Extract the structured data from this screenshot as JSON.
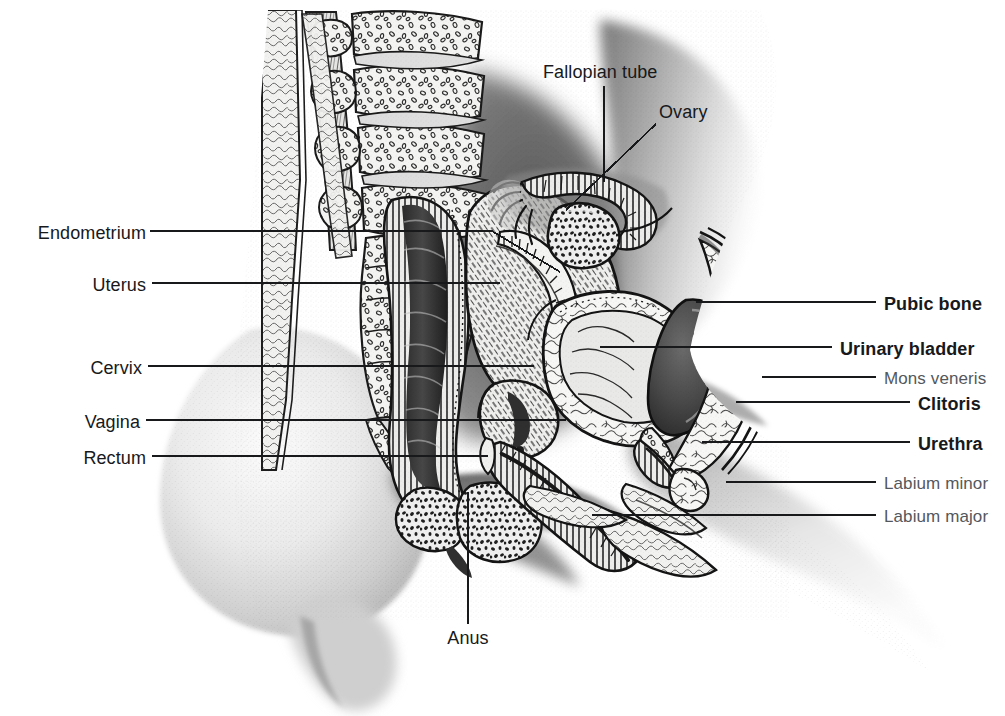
{
  "figure": {
    "style": "black-and-white engraving / stipple illustration",
    "background_color": "#ffffff",
    "ink_color": "#17191b",
    "secondary_ink_color": "#54585c"
  },
  "labels": {
    "left": [
      {
        "id": "endometrium",
        "text": "Endometrium",
        "x": 146,
        "y": 235,
        "leader_to_x": 492,
        "leader_to_y": 235,
        "leader_kink_x": 492,
        "leader_kink_y": 235,
        "leader_end_x": 556,
        "leader_end_y": 272
      },
      {
        "id": "uterus",
        "text": "Uterus",
        "x": 92,
        "y": 288,
        "leader_to_x": 498,
        "leader_to_y": 288,
        "leader_kink_x": 498,
        "leader_kink_y": 288,
        "leader_end_x": 498,
        "leader_end_y": 288
      },
      {
        "id": "cervix",
        "text": "Cervix",
        "x": 95,
        "y": 371,
        "leader_to_x": 530,
        "leader_to_y": 371,
        "leader_kink_x": 530,
        "leader_kink_y": 371,
        "leader_end_x": 530,
        "leader_end_y": 371
      },
      {
        "id": "vagina",
        "text": "Vagina",
        "x": 89,
        "y": 425,
        "leader_to_x": 560,
        "leader_to_y": 425,
        "leader_kink_x": 560,
        "leader_kink_y": 425,
        "leader_end_x": 560,
        "leader_end_y": 425
      },
      {
        "id": "rectum",
        "text": "Rectum",
        "x": 102,
        "y": 461,
        "leader_to_x": 487,
        "leader_to_y": 461,
        "leader_kink_x": 487,
        "leader_kink_y": 461,
        "leader_end_x": 487,
        "leader_end_y": 461
      }
    ],
    "right": [
      {
        "id": "pubic-bone",
        "text": "Pubic bone",
        "x": 884,
        "y": 307,
        "weight": "bold",
        "leader_from_x": 695,
        "leader_from_y": 307
      },
      {
        "id": "urinary-bladder",
        "text": "Urinary bladder",
        "x": 840,
        "y": 352,
        "weight": "bold",
        "leader_from_x": 600,
        "leader_from_y": 352
      },
      {
        "id": "mons-veneris",
        "text": "Mons veneris",
        "x": 886,
        "y": 382,
        "weight": "light",
        "leader_from_x": 760,
        "leader_from_y": 382
      },
      {
        "id": "clitoris",
        "text": "Clitoris",
        "x": 918,
        "y": 407,
        "weight": "bold",
        "leader_from_x": 735,
        "leader_from_y": 407
      },
      {
        "id": "urethra",
        "text": "Urethra",
        "x": 918,
        "y": 447,
        "weight": "bold",
        "leader_from_x": 700,
        "leader_from_y": 447
      },
      {
        "id": "labium-minor",
        "text": "Labium minor",
        "x": 885,
        "y": 487,
        "weight": "light",
        "leader_from_x": 724,
        "leader_from_y": 487
      },
      {
        "id": "labium-major",
        "text": "Labium major",
        "x": 885,
        "y": 520,
        "weight": "light",
        "leader_from_x": 592,
        "leader_from_y": 520
      }
    ],
    "top": [
      {
        "id": "fallopian-tube",
        "text": "Fallopian tube",
        "x": 543,
        "y": 75,
        "leader_x1": 604,
        "leader_y1": 88,
        "leader_x2": 604,
        "leader_y2": 178
      },
      {
        "id": "ovary",
        "text": "Ovary",
        "x": 659,
        "y": 115,
        "leader_x1": 655,
        "leader_y1": 124,
        "leader_x2": 570,
        "leader_y2": 205
      }
    ],
    "bottom": [
      {
        "id": "anus",
        "text": "Anus",
        "x": 468,
        "y": 641,
        "leader_x1": 468,
        "leader_y1": 625,
        "leader_x2": 468,
        "leader_y2": 494
      }
    ]
  },
  "structures": [
    "sacrum and lumbar vertebrae",
    "rectum",
    "uterus with endometrial cavity",
    "cervix",
    "vagina",
    "urinary bladder",
    "pubic bone",
    "urethra",
    "clitoris",
    "mons veneris",
    "labium minor",
    "labium major",
    "anus",
    "ovary",
    "fallopian tube",
    "buttock",
    "thigh",
    "abdominal wall"
  ]
}
